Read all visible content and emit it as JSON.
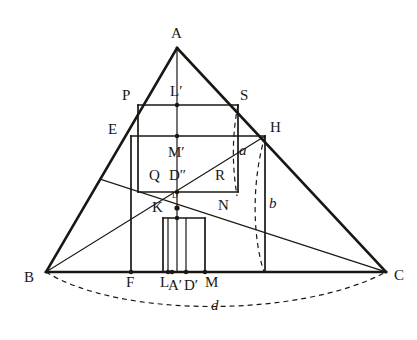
{
  "figure": {
    "kind": "geometric-construction-diagram",
    "background_color": "#ffffff",
    "ink_color": "#1a1713"
  },
  "style": {
    "stroke_heavy": 2.6,
    "stroke_medium": 1.7,
    "stroke_light": 1.2,
    "dash_pattern": "5,4"
  },
  "points": {
    "A": {
      "label": "A",
      "x": 177,
      "y": 48,
      "lx": 171,
      "ly": 26,
      "italic": false,
      "size": "normal"
    },
    "B": {
      "label": "B",
      "x": 46,
      "y": 272,
      "lx": 24,
      "ly": 270,
      "italic": false,
      "size": "normal"
    },
    "C": {
      "label": "C",
      "x": 386,
      "y": 272,
      "lx": 394,
      "ly": 268,
      "italic": false,
      "size": "normal"
    },
    "P": {
      "label": "P",
      "x": 138,
      "y": 105,
      "lx": 122,
      "ly": 88,
      "italic": false,
      "size": "normal"
    },
    "S": {
      "label": "S",
      "x": 238,
      "y": 105,
      "lx": 240,
      "ly": 88,
      "italic": false,
      "size": "normal"
    },
    "Lp": {
      "label": "L′",
      "x": 177,
      "y": 105,
      "lx": 170,
      "ly": 84,
      "italic": false,
      "size": "normal"
    },
    "E": {
      "label": "E",
      "x": 131,
      "y": 136,
      "lx": 108,
      "ly": 122,
      "italic": false,
      "size": "normal"
    },
    "H": {
      "label": "H",
      "x": 265,
      "y": 136,
      "lx": 270,
      "ly": 120,
      "italic": false,
      "size": "normal"
    },
    "Mp": {
      "label": "M′",
      "x": 177,
      "y": 136,
      "lx": 168,
      "ly": 145,
      "italic": false,
      "size": "normal"
    },
    "Q": {
      "label": "Q",
      "x": 150,
      "y": 192,
      "lx": 149,
      "ly": 168,
      "italic": false,
      "size": "normal"
    },
    "R": {
      "label": "R",
      "x": 205,
      "y": 192,
      "lx": 215,
      "ly": 168,
      "italic": false,
      "size": "normal"
    },
    "Dpp": {
      "label": "D″",
      "x": 177,
      "y": 192,
      "lx": 169,
      "ly": 168,
      "italic": false,
      "size": "normal"
    },
    "D": {
      "label": "D",
      "x": 177,
      "y": 208,
      "lx": 172,
      "ly": 192,
      "italic": false,
      "size": "small"
    },
    "K": {
      "label": "K",
      "x": 163,
      "y": 218,
      "lx": 152,
      "ly": 200,
      "italic": false,
      "size": "normal"
    },
    "N": {
      "label": "N",
      "x": 198,
      "y": 218,
      "lx": 218,
      "ly": 198,
      "italic": false,
      "size": "normal"
    },
    "F": {
      "label": "F",
      "x": 131,
      "y": 272,
      "lx": 126,
      "ly": 275,
      "italic": false,
      "size": "normal"
    },
    "L": {
      "label": "L",
      "x": 168,
      "y": 272,
      "lx": 160,
      "ly": 275,
      "italic": false,
      "size": "normal"
    },
    "Ap": {
      "label": "A′",
      "x": 172,
      "y": 272,
      "lx": 168,
      "ly": 278,
      "italic": false,
      "size": "normal"
    },
    "Dp": {
      "label": "D′",
      "x": 186,
      "y": 272,
      "lx": 184,
      "ly": 278,
      "italic": false,
      "size": "normal"
    },
    "M": {
      "label": "M",
      "x": 205,
      "y": 272,
      "lx": 205,
      "ly": 275,
      "italic": false,
      "size": "normal"
    },
    "a": {
      "label": "a",
      "x": 240,
      "y": 155,
      "lx": 239,
      "ly": 143,
      "italic": true,
      "size": "normal"
    },
    "b": {
      "label": "b",
      "x": 268,
      "y": 212,
      "lx": 269,
      "ly": 196,
      "italic": true,
      "size": "normal"
    },
    "d": {
      "label": "d",
      "x": 216,
      "y": 307,
      "lx": 211,
      "ly": 298,
      "italic": true,
      "size": "normal"
    }
  },
  "labels_order": [
    "A",
    "P",
    "Lp",
    "S",
    "E",
    "H",
    "Mp",
    "Q",
    "Dpp",
    "R",
    "D",
    "K",
    "N",
    "B",
    "F",
    "L",
    "Ap",
    "Dp",
    "M",
    "C",
    "a",
    "b",
    "d"
  ],
  "segments": {
    "triangle": [
      {
        "name": "side-AB",
        "x1": 177,
        "y1": 48,
        "x2": 46,
        "y2": 272,
        "weight": "heavy"
      },
      {
        "name": "side-AC",
        "x1": 177,
        "y1": 48,
        "x2": 386,
        "y2": 272,
        "weight": "heavy"
      },
      {
        "name": "side-BC",
        "x1": 46,
        "y1": 272,
        "x2": 386,
        "y2": 272,
        "weight": "heavy"
      }
    ],
    "squares": [
      {
        "name": "square-PSMF-top",
        "x1": 138,
        "y1": 105,
        "x2": 238,
        "y2": 105,
        "weight": "medium"
      },
      {
        "name": "square-P-left",
        "x1": 138,
        "y1": 105,
        "x2": 138,
        "y2": 192,
        "weight": "medium"
      },
      {
        "name": "square-S-right",
        "x1": 238,
        "y1": 105,
        "x2": 238,
        "y2": 192,
        "weight": "medium"
      },
      {
        "name": "square-QR-bottom",
        "x1": 138,
        "y1": 192,
        "x2": 238,
        "y2": 192,
        "weight": "medium"
      },
      {
        "name": "square-EH-top",
        "x1": 131,
        "y1": 136,
        "x2": 265,
        "y2": 136,
        "weight": "medium"
      },
      {
        "name": "square-E-left",
        "x1": 131,
        "y1": 136,
        "x2": 131,
        "y2": 272,
        "weight": "medium"
      },
      {
        "name": "square-H-right",
        "x1": 265,
        "y1": 136,
        "x2": 265,
        "y2": 272,
        "weight": "medium"
      },
      {
        "name": "square-KN-top",
        "x1": 163,
        "y1": 218,
        "x2": 205,
        "y2": 218,
        "weight": "medium"
      },
      {
        "name": "square-K-left",
        "x1": 163,
        "y1": 218,
        "x2": 163,
        "y2": 272,
        "weight": "medium"
      },
      {
        "name": "square-N-right",
        "x1": 205,
        "y1": 218,
        "x2": 205,
        "y2": 272,
        "weight": "medium"
      }
    ],
    "cevians": [
      {
        "name": "altitude-A-to-Ap",
        "x1": 177,
        "y1": 48,
        "x2": 177,
        "y2": 272,
        "weight": "light"
      },
      {
        "name": "line-B-to-H",
        "x1": 46,
        "y1": 272,
        "x2": 265,
        "y2": 136,
        "weight": "light"
      },
      {
        "name": "line-AB-to-C",
        "x1": 100,
        "y1": 179,
        "x2": 386,
        "y2": 272,
        "weight": "light"
      },
      {
        "name": "small-vert-L",
        "x1": 168,
        "y1": 218,
        "x2": 168,
        "y2": 272,
        "weight": "light"
      },
      {
        "name": "small-vert-Dp",
        "x1": 186,
        "y1": 218,
        "x2": 186,
        "y2": 272,
        "weight": "light"
      }
    ]
  },
  "arcs": [
    {
      "name": "arc-a",
      "d": "M 238 105 C 232 135, 232 165, 237 196",
      "label": "a"
    },
    {
      "name": "arc-b",
      "d": "M 265 136 C 252 180, 252 235, 264 272",
      "label": "b"
    },
    {
      "name": "arc-d",
      "d": "M 46 272 C 120 318, 300 318, 386 272",
      "label": "d"
    }
  ],
  "dots": [
    {
      "name": "vertex-dot-Lp",
      "x": 177,
      "y": 105,
      "r": 2.2
    },
    {
      "name": "vertex-dot-Mp",
      "x": 177,
      "y": 136,
      "r": 2.2
    },
    {
      "name": "vertex-dot-Dpp",
      "x": 177,
      "y": 192,
      "r": 2.2
    },
    {
      "name": "vertex-dot-D",
      "x": 177,
      "y": 208,
      "r": 2.6
    },
    {
      "name": "vertex-dot-KN",
      "x": 177,
      "y": 218,
      "r": 2.2
    },
    {
      "name": "vertex-dot-L",
      "x": 168,
      "y": 272,
      "r": 2.2
    },
    {
      "name": "vertex-dot-Ap",
      "x": 172,
      "y": 272,
      "r": 2.2
    },
    {
      "name": "vertex-dot-Dp",
      "x": 186,
      "y": 272,
      "r": 2.2
    },
    {
      "name": "vertex-dot-M",
      "x": 205,
      "y": 272,
      "r": 2.2
    },
    {
      "name": "vertex-dot-F",
      "x": 131,
      "y": 272,
      "r": 2.2
    }
  ]
}
